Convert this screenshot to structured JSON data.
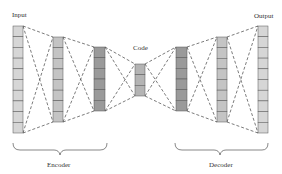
{
  "labels": {
    "input": "Input",
    "code": "Code",
    "output": "Output",
    "encoder": "Encoder",
    "decoder": "Decoder"
  },
  "colors": {
    "light_fill": "#d6d6d6",
    "mid_fill": "#c4c4c4",
    "dark_fill": "#9a9a9a",
    "code_fill": "#b4b4b4",
    "stroke": "#555555",
    "edge": "#444444"
  },
  "layers": [
    {
      "name": "input",
      "role": "encoder",
      "x": 13,
      "y": 26,
      "w": 10,
      "h": 107,
      "cells": 10,
      "shade": "light"
    },
    {
      "name": "encoder-hidden-1",
      "role": "encoder",
      "x": 53,
      "y": 37,
      "w": 10,
      "h": 85,
      "cells": 8,
      "shade": "mid"
    },
    {
      "name": "encoder-hidden-2",
      "role": "encoder",
      "x": 94,
      "y": 47,
      "w": 11,
      "h": 64,
      "cells": 6,
      "shade": "dark"
    },
    {
      "name": "code",
      "role": "bottleneck",
      "x": 135,
      "y": 64,
      "w": 10,
      "h": 32,
      "cells": 3,
      "shade": "code"
    },
    {
      "name": "decoder-hidden-1",
      "role": "decoder",
      "x": 176,
      "y": 47,
      "w": 11,
      "h": 64,
      "cells": 6,
      "shade": "dark"
    },
    {
      "name": "decoder-hidden-2",
      "role": "decoder",
      "x": 217,
      "y": 37,
      "w": 10,
      "h": 85,
      "cells": 8,
      "shade": "mid"
    },
    {
      "name": "output",
      "role": "decoder",
      "x": 258,
      "y": 26,
      "w": 10,
      "h": 107,
      "cells": 10,
      "shade": "light"
    }
  ]
}
